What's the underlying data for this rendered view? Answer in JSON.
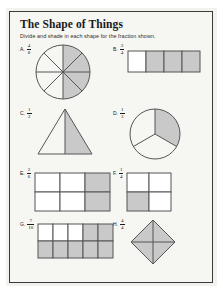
{
  "worksheet": {
    "title": "The Shape of Things",
    "instructions": "Divide and shade in each shape for the fraction shown."
  },
  "problems": [
    {
      "letter": "A.",
      "numerator": "4",
      "denominator": "8",
      "shape": "circle-eighths",
      "shaded_parts": 4,
      "total_parts": 8
    },
    {
      "letter": "B.",
      "numerator": "3",
      "denominator": "4",
      "shape": "rectangle-fourths",
      "shaded_parts": 3,
      "total_parts": 4
    },
    {
      "letter": "C.",
      "numerator": "1",
      "denominator": "2",
      "shape": "triangle-halves",
      "shaded_parts": 1,
      "total_parts": 2
    },
    {
      "letter": "D.",
      "numerator": "1",
      "denominator": "3",
      "shape": "circle-thirds",
      "shaded_parts": 1,
      "total_parts": 3
    },
    {
      "letter": "E.",
      "numerator": "2",
      "denominator": "6",
      "shape": "grid-3x2",
      "shaded_parts": 2,
      "total_parts": 6
    },
    {
      "letter": "F.",
      "numerator": "1",
      "denominator": "4",
      "shape": "grid-2x2",
      "shaded_parts": 1,
      "total_parts": 4
    },
    {
      "letter": "G.",
      "numerator": "7",
      "denominator": "10",
      "shape": "grid-5x2",
      "shaded_parts": 7,
      "total_parts": 10
    },
    {
      "letter": "H.",
      "numerator": "4",
      "denominator": "4",
      "shape": "rhombus-fourths",
      "shaded_parts": 4,
      "total_parts": 4
    }
  ],
  "colors": {
    "shade": "#c9c9c9",
    "stroke": "#555555",
    "frame": "#3a3a3a",
    "paper": "#f6f6f3"
  }
}
